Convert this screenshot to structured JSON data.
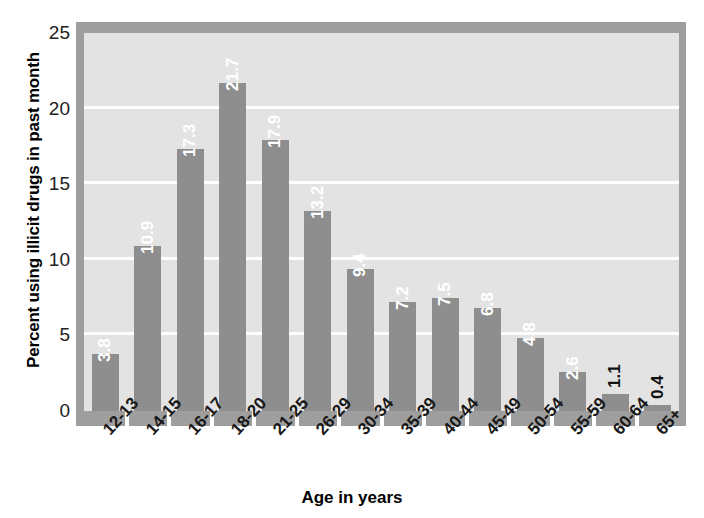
{
  "chart_data": {
    "type": "bar",
    "title": "",
    "xlabel": "Age in years",
    "ylabel": "Percent using illicit drugs in past month",
    "categories": [
      "12-13",
      "14-15",
      "16-17",
      "18-20",
      "21-25",
      "26-29",
      "30-34",
      "35-39",
      "40-44",
      "45-49",
      "50-54",
      "55-59",
      "60-64",
      "65+"
    ],
    "values": [
      3.8,
      10.9,
      17.3,
      21.7,
      17.9,
      13.2,
      9.4,
      7.2,
      7.5,
      6.8,
      4.8,
      2.6,
      1.1,
      0.4
    ],
    "value_labels": [
      "3.8",
      "10.9",
      "17.3",
      "21.7",
      "17.9",
      "13.2",
      "9.4",
      "7.2",
      "7.5",
      "6.8",
      "4.8",
      "2.6",
      "1.1",
      "0.4"
    ],
    "label_placement": [
      "inside",
      "inside",
      "inside",
      "inside",
      "inside",
      "inside",
      "inside",
      "inside",
      "inside",
      "inside",
      "inside",
      "inside",
      "outside",
      "outside"
    ],
    "ylim": [
      0,
      25
    ],
    "yticks": [
      0,
      5,
      10,
      15,
      20,
      25
    ],
    "ytick_labels": [
      "0",
      "5",
      "10",
      "15",
      "20",
      "25"
    ],
    "grid": "horizontal-white",
    "legend": "none",
    "colors": {
      "bar": "#8e8e8e",
      "plot_background": "#e3e3e3",
      "frame": "#9e9e9e",
      "gridline": "#ffffff",
      "inside_label": "#ffffff",
      "outside_label": "#111111",
      "page_background": "#ffffff",
      "text": "#000000"
    }
  }
}
